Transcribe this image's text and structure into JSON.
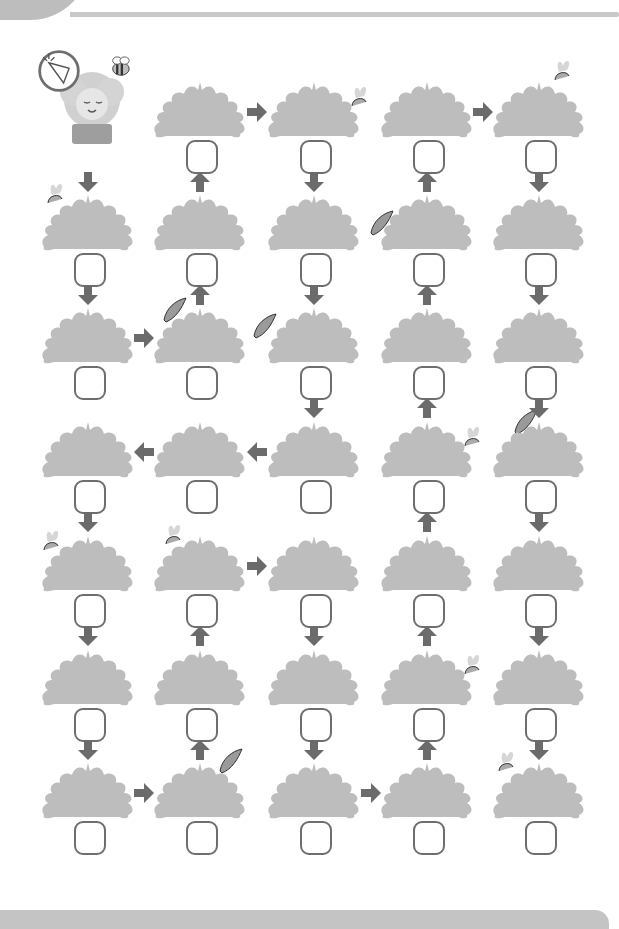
{
  "puzzle": {
    "type": "maze-path",
    "rows": 7,
    "cols": 5,
    "start": {
      "row": 0,
      "col": 0,
      "item": "carrot-badge",
      "character": "sleeping-sheep",
      "companion": "bee"
    },
    "colors": {
      "bush": "#bdbdbd",
      "arrow": "#6b6b6b",
      "box_border": "#6e6e6e",
      "rule": "#c4c4c4",
      "carrot": "#d6d6d6",
      "tip": "#9a9a9a"
    },
    "cells": [
      [
        {
          "kind": "start"
        },
        {
          "kind": "bush",
          "peek": null
        },
        {
          "kind": "bush",
          "peek": "carrot-right"
        },
        {
          "kind": "bush",
          "peek": null
        },
        {
          "kind": "bush",
          "peek": "carrot-top"
        }
      ],
      [
        {
          "kind": "bush",
          "peek": "carrot-topleft"
        },
        {
          "kind": "bush",
          "peek": null
        },
        {
          "kind": "bush",
          "peek": null
        },
        {
          "kind": "bush",
          "peek": "tip-left"
        },
        {
          "kind": "bush",
          "peek": null
        }
      ],
      [
        {
          "kind": "bush",
          "peek": null
        },
        {
          "kind": "bush",
          "peek": "tip-topleft"
        },
        {
          "kind": "bush",
          "peek": "tip-left-big"
        },
        {
          "kind": "bush",
          "peek": null
        },
        {
          "kind": "bush",
          "peek": null
        }
      ],
      [
        {
          "kind": "bush",
          "peek": null
        },
        {
          "kind": "bush",
          "peek": null
        },
        {
          "kind": "bush",
          "peek": null
        },
        {
          "kind": "bush",
          "peek": "carrot-right"
        },
        {
          "kind": "bush",
          "peek": "tip-top"
        }
      ],
      [
        {
          "kind": "bush",
          "peek": "carrot-left"
        },
        {
          "kind": "bush",
          "peek": "carrot-topleft-big"
        },
        {
          "kind": "bush",
          "peek": null
        },
        {
          "kind": "bush",
          "peek": null
        },
        {
          "kind": "bush",
          "peek": null
        }
      ],
      [
        {
          "kind": "bush",
          "peek": null
        },
        {
          "kind": "bush",
          "peek": null
        },
        {
          "kind": "bush",
          "peek": null
        },
        {
          "kind": "bush",
          "peek": "carrot-right"
        },
        {
          "kind": "bush",
          "peek": null
        }
      ],
      [
        {
          "kind": "bush",
          "peek": null
        },
        {
          "kind": "bush",
          "peek": "tip-topright"
        },
        {
          "kind": "bush",
          "peek": null
        },
        {
          "kind": "bush",
          "peek": null
        },
        {
          "kind": "bush",
          "peek": "carrot-topleft"
        }
      ]
    ],
    "arrows": [
      {
        "dir": "right",
        "between": [
          [
            0,
            1
          ],
          [
            0,
            2
          ]
        ]
      },
      {
        "dir": "right",
        "between": [
          [
            0,
            3
          ],
          [
            0,
            4
          ]
        ]
      },
      {
        "dir": "down",
        "between": [
          [
            0,
            0
          ],
          [
            1,
            0
          ]
        ]
      },
      {
        "dir": "up",
        "between": [
          [
            1,
            1
          ],
          [
            0,
            1
          ]
        ]
      },
      {
        "dir": "down",
        "between": [
          [
            0,
            2
          ],
          [
            1,
            2
          ]
        ]
      },
      {
        "dir": "up",
        "between": [
          [
            1,
            3
          ],
          [
            0,
            3
          ]
        ]
      },
      {
        "dir": "down",
        "between": [
          [
            0,
            4
          ],
          [
            1,
            4
          ]
        ]
      },
      {
        "dir": "down",
        "between": [
          [
            1,
            0
          ],
          [
            2,
            0
          ]
        ]
      },
      {
        "dir": "up",
        "between": [
          [
            2,
            1
          ],
          [
            1,
            1
          ]
        ]
      },
      {
        "dir": "down",
        "between": [
          [
            1,
            2
          ],
          [
            2,
            2
          ]
        ]
      },
      {
        "dir": "up",
        "between": [
          [
            2,
            3
          ],
          [
            1,
            3
          ]
        ]
      },
      {
        "dir": "down",
        "between": [
          [
            1,
            4
          ],
          [
            2,
            4
          ]
        ]
      },
      {
        "dir": "right",
        "between": [
          [
            2,
            0
          ],
          [
            2,
            1
          ]
        ]
      },
      {
        "dir": "down",
        "between": [
          [
            2,
            2
          ],
          [
            3,
            2
          ]
        ]
      },
      {
        "dir": "up",
        "between": [
          [
            3,
            3
          ],
          [
            2,
            3
          ]
        ]
      },
      {
        "dir": "down",
        "between": [
          [
            2,
            4
          ],
          [
            3,
            4
          ]
        ]
      },
      {
        "dir": "left",
        "between": [
          [
            3,
            1
          ],
          [
            3,
            0
          ]
        ]
      },
      {
        "dir": "left",
        "between": [
          [
            3,
            2
          ],
          [
            3,
            1
          ]
        ]
      },
      {
        "dir": "down",
        "between": [
          [
            3,
            0
          ],
          [
            4,
            0
          ]
        ]
      },
      {
        "dir": "up",
        "between": [
          [
            4,
            3
          ],
          [
            3,
            3
          ]
        ]
      },
      {
        "dir": "down",
        "between": [
          [
            3,
            4
          ],
          [
            4,
            4
          ]
        ]
      },
      {
        "dir": "right",
        "between": [
          [
            4,
            1
          ],
          [
            4,
            2
          ]
        ]
      },
      {
        "dir": "down",
        "between": [
          [
            4,
            0
          ],
          [
            5,
            0
          ]
        ]
      },
      {
        "dir": "up",
        "between": [
          [
            5,
            1
          ],
          [
            4,
            1
          ]
        ]
      },
      {
        "dir": "down",
        "between": [
          [
            4,
            2
          ],
          [
            5,
            2
          ]
        ]
      },
      {
        "dir": "up",
        "between": [
          [
            5,
            3
          ],
          [
            4,
            3
          ]
        ]
      },
      {
        "dir": "down",
        "between": [
          [
            4,
            4
          ],
          [
            5,
            4
          ]
        ]
      },
      {
        "dir": "down",
        "between": [
          [
            5,
            0
          ],
          [
            6,
            0
          ]
        ]
      },
      {
        "dir": "up",
        "between": [
          [
            6,
            1
          ],
          [
            5,
            1
          ]
        ]
      },
      {
        "dir": "down",
        "between": [
          [
            5,
            2
          ],
          [
            6,
            2
          ]
        ]
      },
      {
        "dir": "up",
        "between": [
          [
            6,
            3
          ],
          [
            5,
            3
          ]
        ]
      },
      {
        "dir": "down",
        "between": [
          [
            5,
            4
          ],
          [
            6,
            4
          ]
        ]
      },
      {
        "dir": "right",
        "between": [
          [
            6,
            0
          ],
          [
            6,
            1
          ]
        ]
      },
      {
        "dir": "right",
        "between": [
          [
            6,
            2
          ],
          [
            6,
            3
          ]
        ]
      }
    ],
    "answers": [
      "",
      "",
      "",
      "",
      "",
      "",
      "",
      "",
      "",
      "",
      "",
      "",
      "",
      "",
      "",
      "",
      "",
      "",
      "",
      "",
      "",
      "",
      "",
      "",
      "",
      "",
      "",
      "",
      "",
      "",
      "",
      "",
      "",
      ""
    ]
  }
}
